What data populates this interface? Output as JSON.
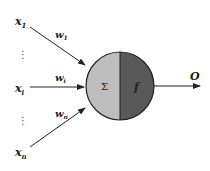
{
  "diagram": {
    "inputs": [
      {
        "label": "x",
        "sub": "1"
      },
      {
        "label": "x",
        "sub": "i"
      },
      {
        "label": "x",
        "sub": "n"
      }
    ],
    "weights": [
      {
        "label": "w",
        "sub": "1"
      },
      {
        "label": "w",
        "sub": "i"
      },
      {
        "label": "w",
        "sub": "n"
      }
    ],
    "ellipsis": "⋮",
    "sum_symbol": "Σ",
    "activation_symbol": "f",
    "output_label": "O",
    "colors": {
      "sum_half": "#bdbdbd",
      "activation_half": "#595959",
      "stroke": "#222222"
    }
  }
}
